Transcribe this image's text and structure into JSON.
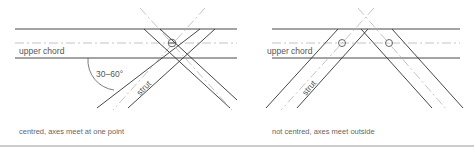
{
  "panels": [
    {
      "id": "centred",
      "chord_label": "upper chord",
      "strut_label": "strut",
      "angle_label": "30–60°",
      "caption": "centred, axes meet at one point"
    },
    {
      "id": "not-centred",
      "chord_label": "upper chord",
      "strut_label": "strut",
      "caption": "not centred, axes meet outside"
    }
  ]
}
